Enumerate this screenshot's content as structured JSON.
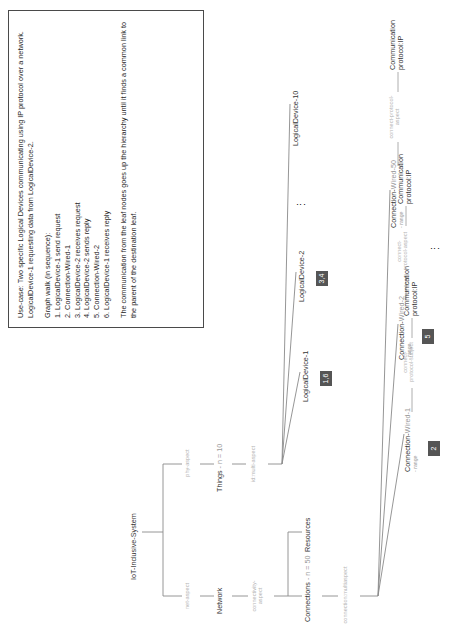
{
  "diagram": {
    "root": {
      "label": "IoT-Inclusive-System"
    },
    "branches": {
      "phy": {
        "edge_label": "phy-aspect",
        "node_label": "Things",
        "node_suffix": " - n = 10",
        "child_edge_label": "id:multi-aspect"
      },
      "net": {
        "edge_label": "net-aspect",
        "node_label": "Network",
        "child_edge_label_line1": "connectivity-",
        "child_edge_label_line2": "aspect"
      }
    },
    "resources": {
      "label": "Resources"
    },
    "connections": {
      "label": "Connections",
      "suffix": " - n = 50",
      "edge_label": "connection:multiaspect"
    },
    "logical_devices": [
      {
        "label": "LogicalDevice-1",
        "badge": "1,6"
      },
      {
        "label": "LogicalDevice-2",
        "badge": "3,4"
      },
      {
        "label": "LogicalDevice-10",
        "badge": ""
      }
    ],
    "logical_devices_ellipsis": "⋮",
    "connection_nodes": [
      {
        "label": "Connection-",
        "suffix": "Wired-1",
        "sub": "- range",
        "badge": "2",
        "protocol_edge_line1": "connect-",
        "protocol_edge_line2": "protocol-subject",
        "protocol_label": "Communication",
        "protocol_value": "protocol:IP"
      },
      {
        "label": "Connection-",
        "suffix": "Wired-2",
        "sub": "- range",
        "badge": "5",
        "protocol_edge_line1": "connect-",
        "protocol_edge_line2": "protocol-aspect",
        "protocol_label": "Communication",
        "protocol_value": "protocol:IP"
      },
      {
        "label": "Connection-",
        "suffix": "Wired-50",
        "sub": "- range",
        "badge": "",
        "protocol_edge_line1": "connect-protocol-",
        "protocol_edge_line2": "aspect",
        "protocol_label": "Communication",
        "protocol_value": "protocol:IP"
      }
    ],
    "connections_ellipsis": "⋮"
  },
  "infobox": {
    "usecase": "Use-case: Two specific Logical Devices communicating using IP protocol over a network. LogicalDevice-1 requesting data from LogicalDevice-2.",
    "graph_walk_title": "Graph walk (in sequence):",
    "steps": [
      "1. LogicalDevice-1 send request",
      "2. Connection-Wired-1",
      "3. LogicalDevice-2 receives request",
      "4. LogicalDevice-2 sends reply",
      "5. Connection-Wired-2",
      "6. LogicalDevice-1 receives reply"
    ],
    "conclusion": "The communication from the leaf nodes goes up the hierarchy until it finds a common link to the parent of the destination leaf."
  },
  "colors": {
    "badge_bg": "#555555",
    "edge_label": "#b4b4b4",
    "node_text": "#333333",
    "line": "#7a7a7a",
    "box_border": "#4a4a4a"
  }
}
